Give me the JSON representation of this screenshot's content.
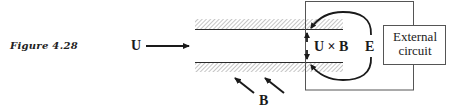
{
  "figure": {
    "caption": "Figure 4.28",
    "labels": {
      "velocity": "U",
      "emf_term": "U × B",
      "field_e": "E",
      "field_b": "B",
      "external_circuit_line1": "External",
      "external_circuit_line2": "circuit"
    },
    "colors": {
      "ink": "#1a1a1a",
      "hatch": "#9a9a9a",
      "box": "#555555",
      "background": "#ffffff"
    }
  }
}
